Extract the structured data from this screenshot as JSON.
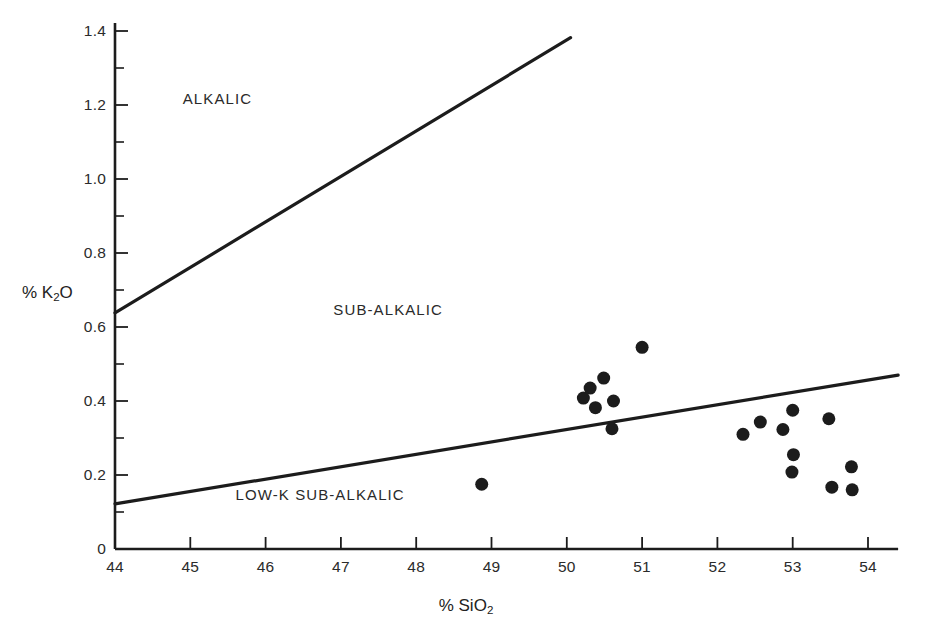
{
  "figure": {
    "background": "#ffffff",
    "ink_color": "#1c1c1c"
  },
  "axis_titles": {
    "x": "% SiO2",
    "x_base": "% SiO",
    "x_sub": "2",
    "y_base": "% K",
    "y_sub": "2",
    "y_tail": "O",
    "y": "% K2O"
  },
  "field_labels": [
    {
      "name": "alkalic",
      "text": "ALKALIC",
      "x": 44.9,
      "y": 1.215
    },
    {
      "name": "sub-alkalic",
      "text": "SUB-ALKALIC",
      "x": 46.9,
      "y": 0.645
    },
    {
      "name": "low-k-sub-alkalic",
      "text": "LOW-K SUB-ALKALIC",
      "x": 45.6,
      "y": 0.145
    }
  ],
  "chart_data": {
    "type": "scatter",
    "title": "",
    "xlabel": "% SiO2",
    "ylabel": "% K2O",
    "xlim": [
      44,
      54.4
    ],
    "ylim": [
      0,
      1.4
    ],
    "grid": false,
    "legend": null,
    "x_ticks": [
      44,
      45,
      46,
      47,
      48,
      49,
      50,
      51,
      52,
      53,
      54
    ],
    "x_tick_labels": [
      "44",
      "45",
      "46",
      "47",
      "48",
      "49",
      "50",
      "51",
      "52",
      "53",
      "54"
    ],
    "x_minor_ticks": [],
    "y_ticks": [
      0,
      0.2,
      0.4,
      0.6,
      0.8,
      1.0,
      1.2,
      1.4
    ],
    "y_tick_labels": [
      "0",
      "0.2",
      "0.4",
      "0.6",
      "0.8",
      "1.0",
      "1.2",
      "1.4"
    ],
    "y_minor_ticks": [
      0.1,
      0.3,
      0.5,
      0.7,
      0.9,
      1.1,
      1.3
    ],
    "marker": {
      "shape": "circle",
      "color": "#1c1c1c",
      "size_px": 13
    },
    "points": [
      {
        "x": 48.87,
        "y": 0.175
      },
      {
        "x": 50.22,
        "y": 0.408
      },
      {
        "x": 50.31,
        "y": 0.435
      },
      {
        "x": 50.38,
        "y": 0.382
      },
      {
        "x": 50.49,
        "y": 0.462
      },
      {
        "x": 50.62,
        "y": 0.4
      },
      {
        "x": 50.6,
        "y": 0.325
      },
      {
        "x": 51.0,
        "y": 0.545
      },
      {
        "x": 52.34,
        "y": 0.31
      },
      {
        "x": 52.57,
        "y": 0.343
      },
      {
        "x": 52.87,
        "y": 0.323
      },
      {
        "x": 53.0,
        "y": 0.375
      },
      {
        "x": 53.01,
        "y": 0.255
      },
      {
        "x": 52.99,
        "y": 0.208
      },
      {
        "x": 53.48,
        "y": 0.352
      },
      {
        "x": 53.78,
        "y": 0.222
      },
      {
        "x": 53.52,
        "y": 0.167
      },
      {
        "x": 53.79,
        "y": 0.16
      }
    ],
    "boundary_lines": [
      {
        "name": "alkalic-subalkalic-boundary",
        "from": {
          "x": 44.0,
          "y": 0.638
        },
        "to": {
          "x": 50.05,
          "y": 1.382
        },
        "width_px": 3.2
      },
      {
        "name": "lowk-subalkalic-boundary",
        "from": {
          "x": 44.0,
          "y": 0.122
        },
        "to": {
          "x": 54.4,
          "y": 0.47
        },
        "width_px": 3.2
      }
    ]
  }
}
